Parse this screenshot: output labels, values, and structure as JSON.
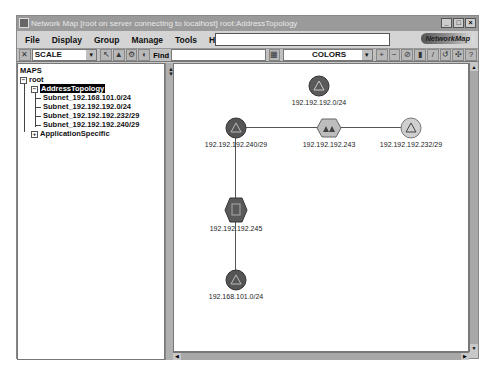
{
  "window": {
    "title": "Network Map   [root on server connecting to localhost]  root:AddressTopology",
    "controls": [
      "_",
      "□",
      "×"
    ]
  },
  "menubar": {
    "items": [
      "File",
      "Display",
      "Group",
      "Manage",
      "Tools",
      "Help"
    ],
    "brand": "NetworkMap"
  },
  "toolbar": {
    "scale_select": "SCALE",
    "find_label": "Find",
    "find_value": "",
    "colors_select": "COLORS",
    "buttons_left": [
      "close-tool",
      "arrow-tool",
      "layout-tool",
      "zoom-tool",
      "filter-tool"
    ],
    "buttons_right": [
      "zoom-in",
      "zoom-out",
      "refresh",
      "alarm",
      "help-context",
      "undo",
      "network",
      "help"
    ]
  },
  "tree": {
    "header": "MAPS",
    "root": "root",
    "selected": "AddressTopology",
    "children": [
      "Subnet_192.168.101.0/24",
      "Subnet_192.192.192.0/24",
      "Subnet_192.192.192.232/29",
      "Subnet_192.192.192.240/29"
    ],
    "collapsed": "ApplicationSpecific"
  },
  "map": {
    "nodes": [
      {
        "id": "n1",
        "label": "192.192.192.0/24",
        "type": "subnet"
      },
      {
        "id": "n2",
        "label": "192.192.192.240/29",
        "type": "subnet"
      },
      {
        "id": "n3",
        "label": "192.192.192.243",
        "type": "router"
      },
      {
        "id": "n4",
        "label": "192.192.192.232/29",
        "type": "subnet-light"
      },
      {
        "id": "n5",
        "label": "192.192.192.245",
        "type": "device"
      },
      {
        "id": "n6",
        "label": "192.168.101.0/24",
        "type": "subnet"
      }
    ]
  }
}
